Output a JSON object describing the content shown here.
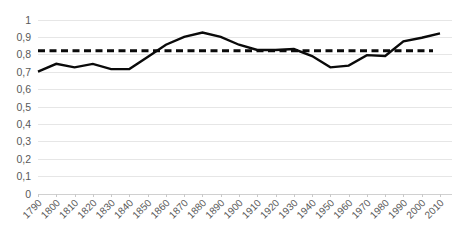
{
  "chart_data": {
    "type": "line",
    "title": "",
    "xlabel": "",
    "ylabel": "",
    "grid": true,
    "legend": false,
    "decimal_separator": ",",
    "x": [
      1790,
      1800,
      1810,
      1820,
      1830,
      1840,
      1850,
      1860,
      1870,
      1880,
      1890,
      1900,
      1910,
      1920,
      1930,
      1940,
      1950,
      1960,
      1970,
      1980,
      1990,
      2000,
      2010
    ],
    "xtick_labels": [
      "1790",
      "1800",
      "1810",
      "1820",
      "1830",
      "1840",
      "1850",
      "1860",
      "1870",
      "1880",
      "1890",
      "1900",
      "1910",
      "1920",
      "1930",
      "1940",
      "1950",
      "1960",
      "1970",
      "1980",
      "1990",
      "2000",
      "2010"
    ],
    "ytick_labels": [
      "0",
      "0,1",
      "0,2",
      "0,3",
      "0,4",
      "0,5",
      "0,6",
      "0,7",
      "0,8",
      "0,9",
      "1"
    ],
    "ytick_values": [
      0,
      0.1,
      0.2,
      0.3,
      0.4,
      0.5,
      0.6,
      0.7,
      0.8,
      0.9,
      1
    ],
    "ylim": [
      0,
      1
    ],
    "xlim": [
      1790,
      2010
    ],
    "series": [
      {
        "name": "value",
        "color": "#0a0a0a",
        "style": "solid",
        "values": [
          0.7,
          0.745,
          0.725,
          0.745,
          0.715,
          0.715,
          0.785,
          0.855,
          0.9,
          0.925,
          0.9,
          0.855,
          0.825,
          0.825,
          0.83,
          0.79,
          0.725,
          0.735,
          0.795,
          0.79,
          0.875,
          0.895,
          0.92
        ]
      },
      {
        "name": "reference",
        "color": "#0a0a0a",
        "style": "dashed",
        "constant": 0.82
      }
    ]
  }
}
